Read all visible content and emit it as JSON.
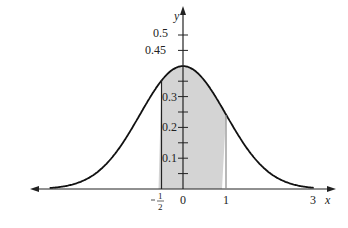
{
  "chart_data": {
    "type": "area",
    "title": "",
    "xlabel": "x",
    "ylabel": "y",
    "function": "standard normal density",
    "shaded_interval": [
      -0.5,
      1
    ],
    "x_ticks": [
      "-1/2",
      "0",
      "1",
      "3"
    ],
    "y_ticks": [
      "0.1",
      "0.2",
      "0.3",
      "0.45",
      "0.5"
    ],
    "peak_value": 0.4,
    "xlim": [
      -3.5,
      3.5
    ],
    "ylim": [
      0,
      0.55
    ],
    "grid": false
  },
  "labels": {
    "x_axis": "x",
    "y_axis": "y",
    "xt_neg_half_num": "1",
    "xt_neg_half_den": "2",
    "xt_zero": "0",
    "xt_one": "1",
    "xt_three": "3",
    "yt_01": "0.1",
    "yt_02": "0.2",
    "yt_03": "0.3",
    "yt_045": "0.45",
    "yt_05": "0.5"
  }
}
